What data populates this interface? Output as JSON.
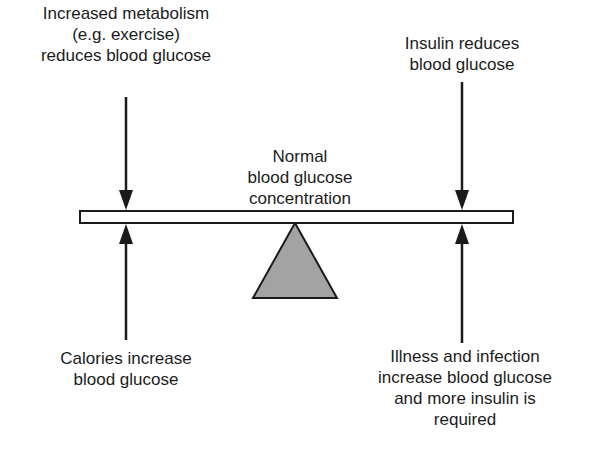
{
  "diagram": {
    "type": "balance-seesaw",
    "center_label": "Normal\nblood glucose\nconcentration",
    "forces": [
      {
        "id": "top-left",
        "direction": "down",
        "effect": "reduces",
        "text": "Increased metabolism\n(e.g. exercise)\nreduces blood glucose"
      },
      {
        "id": "top-right",
        "direction": "down",
        "effect": "reduces",
        "text": "Insulin reduces\nblood glucose"
      },
      {
        "id": "bottom-left",
        "direction": "up",
        "effect": "increases",
        "text": "Calories increase\nblood glucose"
      },
      {
        "id": "bottom-right",
        "direction": "up",
        "effect": "increases",
        "text": "Illness and infection\nincrease blood glucose\nand more insulin is\nrequired"
      }
    ],
    "colors": {
      "line": "#1a1a1a",
      "beam_fill": "#ffffff",
      "fulcrum_fill": "#a3a3a3",
      "background": "#ffffff"
    }
  }
}
